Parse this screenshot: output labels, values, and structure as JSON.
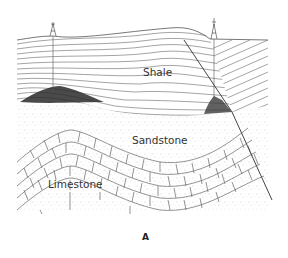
{
  "diagram": {
    "caption": "A",
    "layers": [
      {
        "name": "shale",
        "label": "Shale"
      },
      {
        "name": "sandstone",
        "label": "Sandstone"
      },
      {
        "name": "limestone",
        "label": "Limestone"
      }
    ],
    "features": [
      {
        "name": "oil-derrick-left"
      },
      {
        "name": "oil-derrick-right"
      },
      {
        "name": "oil-trap-anticline"
      },
      {
        "name": "oil-trap-fault"
      },
      {
        "name": "fault-line"
      }
    ],
    "colors": {
      "line": "#555555",
      "oil": "#2a2a2a",
      "stipple": "#999999"
    }
  }
}
